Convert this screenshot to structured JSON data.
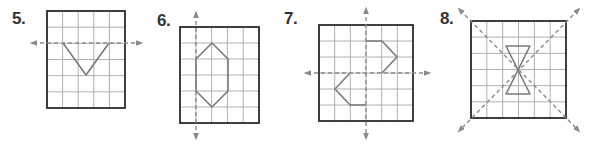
{
  "exercises": [
    {
      "number": "5.",
      "label_pos": [
        12,
        10
      ],
      "grid": {
        "x": 47,
        "y": 11,
        "w": 78,
        "h": 97,
        "cols": 5,
        "rows": 6
      },
      "axes_of_symmetry": [
        {
          "type": "horizontal",
          "x1": 33,
          "y1": 43,
          "x2": 140,
          "y2": 43,
          "arrows": "both"
        }
      ],
      "shape": {
        "type": "polyline",
        "points": [
          [
            63,
            43
          ],
          [
            86,
            75
          ],
          [
            109,
            43
          ]
        ]
      }
    },
    {
      "number": "6.",
      "label_pos": [
        157,
        12
      ],
      "grid": {
        "x": 180,
        "y": 27,
        "w": 79,
        "h": 96,
        "cols": 5,
        "rows": 6
      },
      "axes_of_symmetry": [
        {
          "type": "vertical",
          "x1": 196,
          "y1": 14,
          "x2": 196,
          "y2": 137,
          "arrows": "both"
        }
      ],
      "shape": {
        "type": "polygon",
        "points": [
          [
            212,
            43
          ],
          [
            228,
            59
          ],
          [
            228,
            91
          ],
          [
            212,
            107
          ],
          [
            196,
            91
          ],
          [
            196,
            59
          ]
        ]
      }
    },
    {
      "number": "7.",
      "label_pos": [
        284,
        10
      ],
      "grid": {
        "x": 319,
        "y": 25,
        "w": 94,
        "h": 96,
        "cols": 6,
        "rows": 6
      },
      "axes_of_symmetry": [
        {
          "type": "horizontal",
          "x1": 307,
          "y1": 73,
          "x2": 428,
          "y2": 73,
          "arrows": "both"
        },
        {
          "type": "vertical",
          "x1": 366,
          "y1": 10,
          "x2": 366,
          "y2": 137,
          "arrows": "both"
        }
      ],
      "shapes": [
        {
          "type": "polyline",
          "points": [
            [
              366,
              41
            ],
            [
              382,
              41
            ],
            [
              397,
              57
            ],
            [
              382,
              73
            ]
          ]
        },
        {
          "type": "polyline",
          "points": [
            [
              350,
              73
            ],
            [
              335,
              89
            ],
            [
              350,
              105
            ],
            [
              366,
              105
            ]
          ]
        }
      ]
    },
    {
      "number": "8.",
      "label_pos": [
        440,
        10
      ],
      "grid": {
        "x": 471,
        "y": 21,
        "w": 95,
        "h": 97,
        "cols": 6,
        "rows": 6
      },
      "axes_of_symmetry": [
        {
          "type": "diagonal",
          "x1": 460,
          "y1": 10,
          "x2": 578,
          "y2": 130,
          "arrows": "both"
        },
        {
          "type": "diagonal",
          "x1": 578,
          "y1": 10,
          "x2": 460,
          "y2": 130,
          "arrows": "both"
        }
      ],
      "shape": {
        "type": "polygon",
        "points": [
          [
            506,
            46
          ],
          [
            530,
            46
          ],
          [
            506,
            94
          ],
          [
            530,
            94
          ]
        ]
      }
    }
  ],
  "colors": {
    "grid_line": "#b0b0b0",
    "grid_border": "#2b2b2b",
    "shape_stroke": "#7a7a7a",
    "axis_dash": "#8a8a8a",
    "label": "#333333"
  }
}
